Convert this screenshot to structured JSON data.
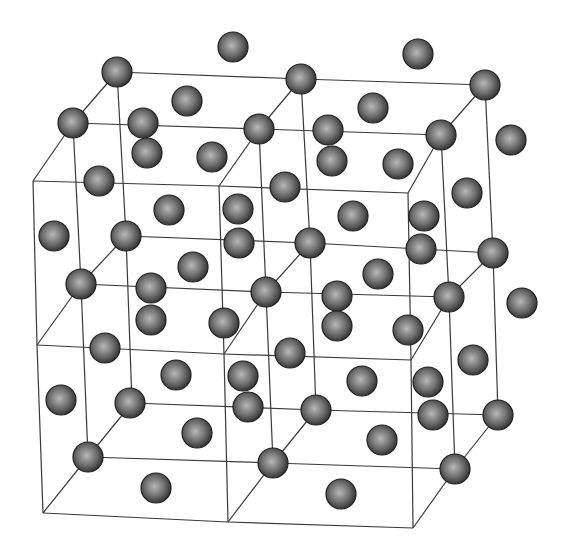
{
  "diagram": {
    "type": "crystal-lattice",
    "colors": {
      "background": "#ffffff",
      "edge": "#3a3a3a",
      "atom_light": "#b8b8b8",
      "atom_mid": "#6e6e6e",
      "atom_dark": "#2a2a2a"
    },
    "atom_radius": 15,
    "edges": [
      [
        117,
        72,
        301,
        79
      ],
      [
        301,
        79,
        485,
        85
      ],
      [
        73,
        123,
        259,
        129
      ],
      [
        259,
        129,
        441,
        135
      ],
      [
        33,
        181,
        219,
        186
      ],
      [
        219,
        186,
        408,
        193
      ],
      [
        117,
        72,
        73,
        123
      ],
      [
        73,
        123,
        33,
        181
      ],
      [
        301,
        79,
        259,
        129
      ],
      [
        259,
        129,
        219,
        186
      ],
      [
        485,
        85,
        441,
        135
      ],
      [
        441,
        135,
        408,
        193
      ],
      [
        117,
        72,
        126,
        236
      ],
      [
        126,
        236,
        132,
        403
      ],
      [
        73,
        123,
        81,
        284
      ],
      [
        81,
        284,
        88,
        457
      ],
      [
        33,
        181,
        37,
        345
      ],
      [
        37,
        345,
        43,
        513
      ],
      [
        301,
        79,
        310,
        243
      ],
      [
        310,
        243,
        316,
        410
      ],
      [
        259,
        129,
        266,
        292
      ],
      [
        266,
        292,
        273,
        463
      ],
      [
        219,
        186,
        224,
        354
      ],
      [
        224,
        354,
        228,
        522
      ],
      [
        485,
        85,
        493,
        253
      ],
      [
        493,
        253,
        498,
        415
      ],
      [
        441,
        135,
        449,
        297
      ],
      [
        449,
        297,
        455,
        469
      ],
      [
        408,
        193,
        411,
        360
      ],
      [
        411,
        360,
        413,
        528
      ],
      [
        126,
        236,
        310,
        243
      ],
      [
        310,
        243,
        493,
        253
      ],
      [
        81,
        284,
        266,
        292
      ],
      [
        266,
        292,
        449,
        297
      ],
      [
        37,
        345,
        224,
        354
      ],
      [
        224,
        354,
        411,
        360
      ],
      [
        126,
        236,
        81,
        284
      ],
      [
        81,
        284,
        37,
        345
      ],
      [
        310,
        243,
        266,
        292
      ],
      [
        266,
        292,
        224,
        354
      ],
      [
        493,
        253,
        449,
        297
      ],
      [
        449,
        297,
        411,
        360
      ],
      [
        132,
        403,
        316,
        410
      ],
      [
        316,
        410,
        498,
        415
      ],
      [
        88,
        457,
        273,
        463
      ],
      [
        273,
        463,
        455,
        469
      ],
      [
        43,
        513,
        228,
        522
      ],
      [
        228,
        522,
        413,
        528
      ],
      [
        132,
        403,
        88,
        457
      ],
      [
        88,
        457,
        43,
        513
      ],
      [
        316,
        410,
        273,
        463
      ],
      [
        273,
        463,
        228,
        522
      ],
      [
        498,
        415,
        455,
        469
      ],
      [
        455,
        469,
        413,
        528
      ]
    ],
    "atoms": [
      [
        233,
        47
      ],
      [
        418,
        54
      ],
      [
        117,
        72
      ],
      [
        301,
        79
      ],
      [
        485,
        85
      ],
      [
        187,
        101
      ],
      [
        373,
        108
      ],
      [
        73,
        123
      ],
      [
        143,
        123
      ],
      [
        259,
        129
      ],
      [
        328,
        130
      ],
      [
        441,
        135
      ],
      [
        511,
        140
      ],
      [
        147,
        153
      ],
      [
        212,
        157
      ],
      [
        332,
        161
      ],
      [
        398,
        164
      ],
      [
        99,
        181
      ],
      [
        285,
        187
      ],
      [
        467,
        193
      ],
      [
        169,
        210
      ],
      [
        238,
        209
      ],
      [
        353,
        216
      ],
      [
        424,
        216
      ],
      [
        54,
        236
      ],
      [
        126,
        236
      ],
      [
        239,
        243
      ],
      [
        310,
        243
      ],
      [
        421,
        249
      ],
      [
        493,
        253
      ],
      [
        193,
        267
      ],
      [
        378,
        274
      ],
      [
        81,
        284
      ],
      [
        151,
        288
      ],
      [
        266,
        292
      ],
      [
        337,
        296
      ],
      [
        449,
        297
      ],
      [
        522,
        303
      ],
      [
        151,
        320
      ],
      [
        224,
        323
      ],
      [
        337,
        326
      ],
      [
        408,
        330
      ],
      [
        105,
        348
      ],
      [
        290,
        353
      ],
      [
        473,
        360
      ],
      [
        176,
        375
      ],
      [
        243,
        376
      ],
      [
        362,
        381
      ],
      [
        428,
        382
      ],
      [
        61,
        400
      ],
      [
        130,
        403
      ],
      [
        248,
        407
      ],
      [
        316,
        410
      ],
      [
        433,
        415
      ],
      [
        498,
        415
      ],
      [
        197,
        433
      ],
      [
        382,
        440
      ],
      [
        88,
        457
      ],
      [
        273,
        463
      ],
      [
        455,
        469
      ],
      [
        156,
        488
      ],
      [
        341,
        494
      ]
    ]
  }
}
